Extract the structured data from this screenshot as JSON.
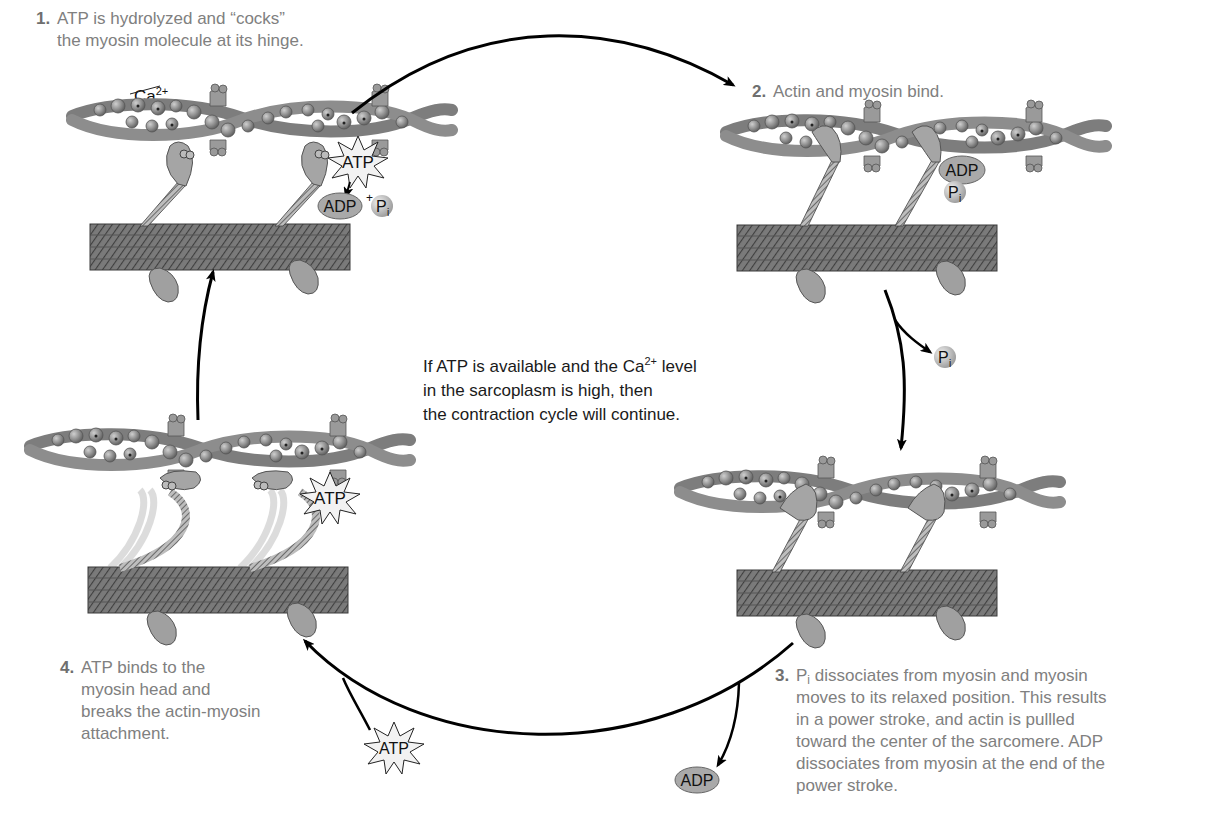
{
  "figure": {
    "center_note": {
      "lines": [
        "If ATP is available and the Ca2+ level",
        "in the sarcoplasm is high, then",
        "the contraction cycle will continue."
      ],
      "line1_pre": "If ATP is available and the Ca",
      "line1_sup": "2+",
      "line1_post": " level",
      "line2": "in the sarcoplasm is high, then",
      "line3": "the contraction cycle will continue."
    },
    "steps": [
      {
        "number": "1.",
        "lines": [
          "ATP is hydrolyzed and “cocks”",
          "the myosin molecule at its hinge."
        ],
        "panel_labels": {
          "ion": "Ca",
          "ion_charge": "2+",
          "molecule": "ATP",
          "products_main": "ADP",
          "products_plus": "+",
          "products_pi": "P",
          "products_pi_sub": "i"
        }
      },
      {
        "number": "2.",
        "lines": [
          "Actin and myosin bind."
        ],
        "panel_labels": {
          "bound_adp": "ADP",
          "bound_pi": "P",
          "bound_pi_sub": "i"
        }
      },
      {
        "number": "3.",
        "lines_first_pre": "P",
        "lines_first_sub": "i",
        "lines_first_post": " dissociates from myosin and myosin",
        "lines": [
          "Pi dissociates from myosin and myosin",
          "moves to its relaxed position. This results",
          "in a power stroke, and actin is pullled",
          "toward the center of the sarcomere. ADP",
          "dissociates from myosin at the end of the",
          "power stroke."
        ],
        "released": [
          "P",
          "i",
          "ADP"
        ]
      },
      {
        "number": "4.",
        "lines": [
          "ATP binds to the",
          "myosin head and",
          "breaks the actin-myosin",
          "attachment."
        ],
        "panel_labels": {
          "molecule": "ATP"
        },
        "incoming": "ATP"
      }
    ],
    "colors": {
      "caption_text": "#808080",
      "note_text": "#1a1a1a",
      "arrow": "#000000",
      "protein_fill": "#8a8a8a",
      "protein_dark": "#5a5a5a",
      "thick_filament": "#6e6e6e",
      "badge_fill": "#a9a9a9",
      "starburst_fill": "#f2f2f2"
    }
  }
}
